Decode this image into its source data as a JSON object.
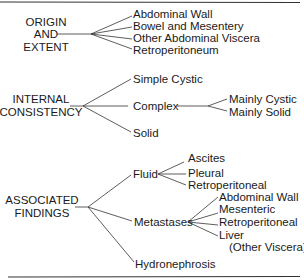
{
  "diagram": {
    "type": "classification-tree",
    "groups": [
      {
        "label_lines": [
          "ORIGIN",
          "AND",
          "EXTENT"
        ],
        "children": [
          {
            "label": "Abdominal Wall"
          },
          {
            "label": "Bowel and Mesentery"
          },
          {
            "label": "Other Abdominal Viscera"
          },
          {
            "label": "Retroperitoneum"
          }
        ]
      },
      {
        "label_lines": [
          "INTERNAL",
          "CONSISTENCY"
        ],
        "children": [
          {
            "label": "Simple Cystic"
          },
          {
            "label": "Complex",
            "children": [
              {
                "label": "Mainly Cystic"
              },
              {
                "label": "Mainly Solid"
              }
            ]
          },
          {
            "label": "Solid"
          }
        ]
      },
      {
        "label_lines": [
          "ASSOCIATED",
          "FINDINGS"
        ],
        "children": [
          {
            "label": "Fluid",
            "children": [
              {
                "label": "Ascites"
              },
              {
                "label": "Pleural"
              },
              {
                "label": "Retroperitoneal"
              }
            ]
          },
          {
            "label": "Metastases",
            "children": [
              {
                "label": "Abdominal Wall"
              },
              {
                "label": "Mesenteric"
              },
              {
                "label": "Retroperitoneal"
              },
              {
                "label": "Liver"
              },
              {
                "label": "(Other Viscera)"
              }
            ]
          },
          {
            "label": "Hydronephrosis"
          }
        ]
      }
    ]
  }
}
